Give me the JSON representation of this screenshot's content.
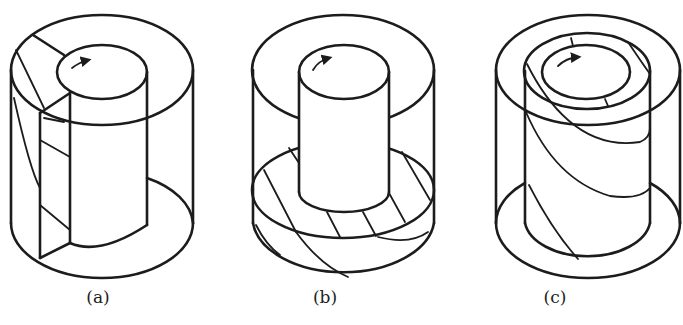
{
  "figure": {
    "panels": [
      {
        "id": "a",
        "label": "(a)",
        "center_x": 98,
        "description": "Coaxial cylinders cut open by a vertical plane; inner cylinder rotating"
      },
      {
        "id": "b",
        "label": "(b)",
        "center_x": 325,
        "description": "Inner cylinder rotating above hatched fluid layer at bottom"
      },
      {
        "id": "c",
        "label": "(c)",
        "center_x": 555,
        "description": "Three coaxial cylinders; middle shell with helical stripes; inner cylinder rotating"
      }
    ],
    "rotation_arrow": "clockwise-arrow",
    "colors": {
      "stroke": "#1c1c1c",
      "background": "#ffffff"
    }
  }
}
